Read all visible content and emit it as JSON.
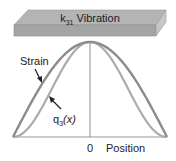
{
  "beam": {
    "label_main": "k",
    "label_sub": "31",
    "label_rest": " Vibration",
    "colors": {
      "top": "#b4b4b4",
      "front": "#a2a2a2",
      "side": "#c8c8c8",
      "edge": "#8a8a8a"
    }
  },
  "chart_data": {
    "type": "line",
    "title": "k31 Vibration",
    "xlabel": "Position",
    "ylabel": "",
    "x_tick_labels": [
      "0"
    ],
    "grid": false,
    "series": [
      {
        "name": "Strain",
        "shape": "cos(pi*x/L)",
        "color": "#8c8c8c",
        "x": [
          -1,
          -0.75,
          -0.5,
          -0.25,
          0,
          0.25,
          0.5,
          0.75,
          1
        ],
        "values": [
          0,
          0.38,
          0.71,
          0.92,
          1,
          0.92,
          0.71,
          0.38,
          0
        ]
      },
      {
        "name": "q3(x)",
        "shape": "cos^2(pi*x/L)",
        "color": "#ababab",
        "x": [
          -1,
          -0.75,
          -0.5,
          -0.25,
          0,
          0.25,
          0.5,
          0.75,
          1
        ],
        "values": [
          0,
          0.15,
          0.5,
          0.85,
          1,
          0.85,
          0.5,
          0.15,
          0
        ]
      }
    ],
    "annotations": [
      {
        "text": "Strain",
        "arrow_to": "Strain curve"
      },
      {
        "text": "q3(x)",
        "arrow_to": "q3 curve"
      }
    ]
  },
  "labels": {
    "strain": "Strain",
    "q_main": "q",
    "q_sub": "3",
    "q_rest": "(x)",
    "zero": "0",
    "position": "Position"
  }
}
